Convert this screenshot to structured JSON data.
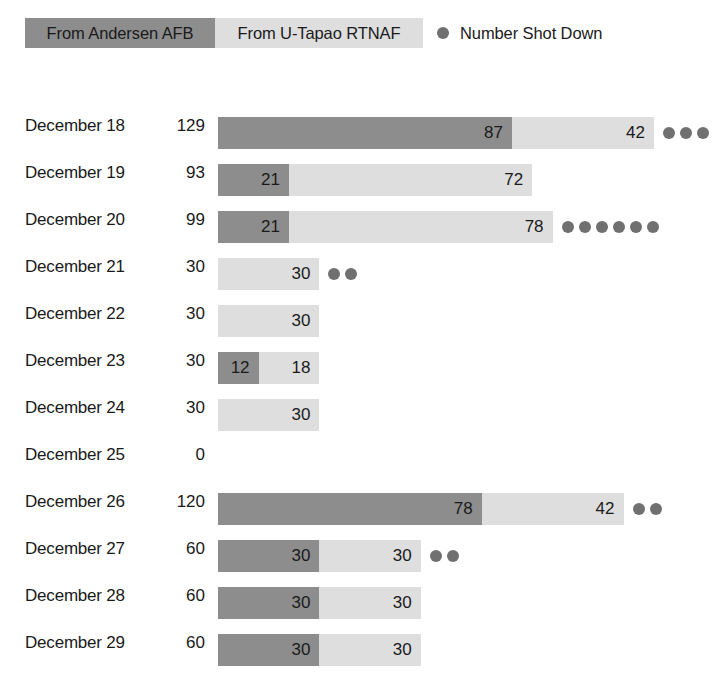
{
  "legend": {
    "items": [
      {
        "label": "From Andersen AFB",
        "type": "swatch",
        "color": "#8d8d8d",
        "icon": "dark-swatch"
      },
      {
        "label": "From U-Tapao RTNAF",
        "type": "swatch",
        "color": "#dedede",
        "icon": "light-swatch"
      },
      {
        "label": "Number Shot Down",
        "type": "dot",
        "color": "#707070",
        "icon": "dot-marker"
      }
    ]
  },
  "chart_data": {
    "type": "bar",
    "title": "",
    "subtitle": "",
    "xlabel": "",
    "ylabel": "",
    "orientation": "horizontal",
    "stacked": true,
    "grid": false,
    "legend_position": "top-left",
    "axis_visible": false,
    "units_per_pixel": 0.2959,
    "categories": [
      "December 18",
      "December 19",
      "December 20",
      "December 21",
      "December 22",
      "December 23",
      "December 24",
      "December 25",
      "December 26",
      "December 27",
      "December 28",
      "December 29"
    ],
    "totals": [
      129,
      93,
      99,
      30,
      30,
      30,
      30,
      0,
      120,
      60,
      60,
      60
    ],
    "series": [
      {
        "name": "From Andersen AFB",
        "color": "#8d8d8d",
        "values": [
          87,
          21,
          21,
          0,
          0,
          12,
          0,
          0,
          78,
          30,
          30,
          30
        ]
      },
      {
        "name": "From U-Tapao RTNAF",
        "color": "#dedede",
        "values": [
          42,
          72,
          78,
          30,
          30,
          18,
          30,
          0,
          42,
          30,
          30,
          30
        ]
      }
    ],
    "shot_down": {
      "name": "Number Shot Down",
      "color": "#707070",
      "values": [
        3,
        0,
        6,
        2,
        0,
        0,
        0,
        0,
        2,
        2,
        0,
        0
      ]
    }
  }
}
